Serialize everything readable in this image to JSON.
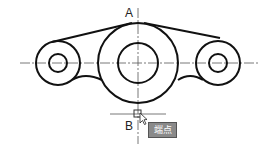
{
  "drawing": {
    "label_top": "A",
    "label_bottom": "B",
    "snap_tooltip": "端点",
    "line_color": "#111111",
    "centerline_color": "#555555",
    "tooltip_bg": "#8a8a8a"
  }
}
